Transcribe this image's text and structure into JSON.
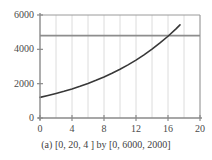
{
  "caption": "(a)  [0, 20, 4 ] by [0, 6000, 2000]",
  "colors": {
    "curve": "#383838",
    "hline": "#8d8d8d",
    "axis": "#8a8a8a",
    "grid": "#dcdcdc",
    "frame": "#9a9a9a",
    "text": "#3f3f3f",
    "background": "#ffffff"
  },
  "chart_data": {
    "type": "line",
    "title": "",
    "subtitle": "",
    "xlabel": "",
    "ylabel": "",
    "xlim": [
      0,
      20
    ],
    "ylim": [
      0,
      6000
    ],
    "xtick_step": 4,
    "ytick_step": 2000,
    "xticks": [
      0,
      4,
      8,
      12,
      16,
      20
    ],
    "xtick_labels": [
      "0",
      "4",
      "8",
      "12",
      "16",
      "20"
    ],
    "yticks": [
      0,
      2000,
      4000,
      6000
    ],
    "ytick_labels": [
      "0",
      "2000",
      "4000",
      "6000"
    ],
    "xminor_step": 2,
    "grid": true,
    "grid_axis": "x",
    "legend": false,
    "legend_position": "none",
    "series": [
      {
        "name": "exponential-growth",
        "type": "line",
        "color": "#383838",
        "clipped_at_top": true,
        "x": [
          0,
          1,
          2,
          3,
          4,
          5,
          6,
          7,
          8,
          9,
          10,
          11,
          12,
          13,
          14,
          15,
          16,
          17,
          17.5
        ],
        "values": [
          1200,
          1308,
          1426,
          1554,
          1694,
          1846,
          2012,
          2193,
          2391,
          2606,
          2840,
          3096,
          3374,
          3678,
          4009,
          4370,
          4763,
          5192,
          5423
        ]
      },
      {
        "name": "horizontal-reference-line",
        "type": "hline",
        "color": "#8d8d8d",
        "y": 4800,
        "x": [
          0,
          20
        ],
        "values": [
          4800,
          4800
        ]
      }
    ],
    "annotations": [
      {
        "name": "intersection",
        "x": 16.1,
        "y": 4800,
        "label": ""
      }
    ]
  }
}
